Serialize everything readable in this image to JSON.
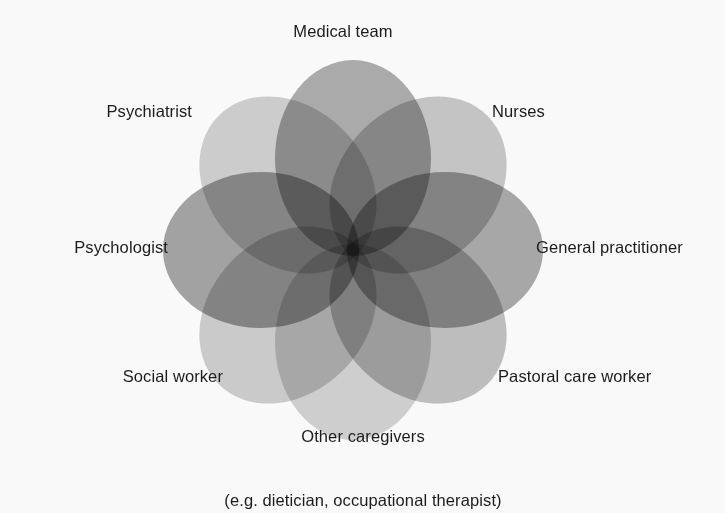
{
  "figure": {
    "type": "venn-rosette",
    "background_color": "#f9f9f9",
    "text_color": "#1c1c1c",
    "center": {
      "x": 353,
      "y": 250
    },
    "petal_count": 8
  },
  "labels": {
    "medical_team": "Medical team",
    "nurses": "Nurses",
    "general_practitioner": "General practitioner",
    "pastoral_care_worker": "Pastoral care worker",
    "other_caregivers_line1": "Other caregivers",
    "other_caregivers_line2": "(e.g. dietician, occupational therapist)",
    "social_worker": "Social worker",
    "psychologist": "Psychologist",
    "psychiatrist": "Psychiatrist"
  },
  "chart_data": {
    "type": "pie",
    "title": "",
    "xlabel": "",
    "ylabel": "",
    "legend_position": "around-perimeter",
    "grid": false,
    "categories": [
      "Medical team",
      "Nurses",
      "General practitioner",
      "Pastoral care worker",
      "Other caregivers (e.g. dietician, occupational therapist)",
      "Social worker",
      "Psychologist",
      "Psychiatrist"
    ],
    "values": [
      1,
      1,
      1,
      1,
      1,
      1,
      1,
      1
    ],
    "petals": [
      {
        "label": "Medical team",
        "angle_deg": 270,
        "fill": "#8f8f8f",
        "opacity": 0.72
      },
      {
        "label": "Nurses",
        "angle_deg": 315,
        "fill": "#b4b4b4",
        "opacity": 0.72
      },
      {
        "label": "General practitioner",
        "angle_deg": 0,
        "fill": "#8a8a8a",
        "opacity": 0.72
      },
      {
        "label": "Pastoral care worker",
        "angle_deg": 45,
        "fill": "#ababab",
        "opacity": 0.72
      },
      {
        "label": "Other caregivers",
        "angle_deg": 90,
        "fill": "#c2c2c2",
        "opacity": 0.72
      },
      {
        "label": "Social worker",
        "angle_deg": 135,
        "fill": "#bdbdbd",
        "opacity": 0.72
      },
      {
        "label": "Psychologist",
        "angle_deg": 180,
        "fill": "#878787",
        "opacity": 0.74
      },
      {
        "label": "Psychiatrist",
        "angle_deg": 225,
        "fill": "#bfbfbf",
        "opacity": 0.72
      }
    ]
  }
}
